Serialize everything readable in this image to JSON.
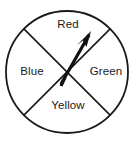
{
  "figure": {
    "kind": "spinner-wheel",
    "stroke_color": "#1a1a1a",
    "fill_color": "#ffffff",
    "text_color": "#1a1a1a"
  },
  "wheel": {
    "center_x": 67,
    "center_y": 72,
    "radius": 62,
    "sector_count": 4,
    "divider_angles_deg": [
      45,
      135
    ],
    "sectors": [
      {
        "name": "red-sector",
        "label": "Red",
        "position": "top"
      },
      {
        "name": "green-sector",
        "label": "Green",
        "position": "right"
      },
      {
        "name": "yellow-sector",
        "label": "Yellow",
        "position": "bottom"
      },
      {
        "name": "blue-sector",
        "label": "Blue",
        "position": "left"
      }
    ]
  },
  "pointer": {
    "name": "spinner-arrow",
    "points_to": "Red",
    "tail_x": 61,
    "tail_y": 84,
    "tip_x": 91,
    "tip_y": 32
  }
}
